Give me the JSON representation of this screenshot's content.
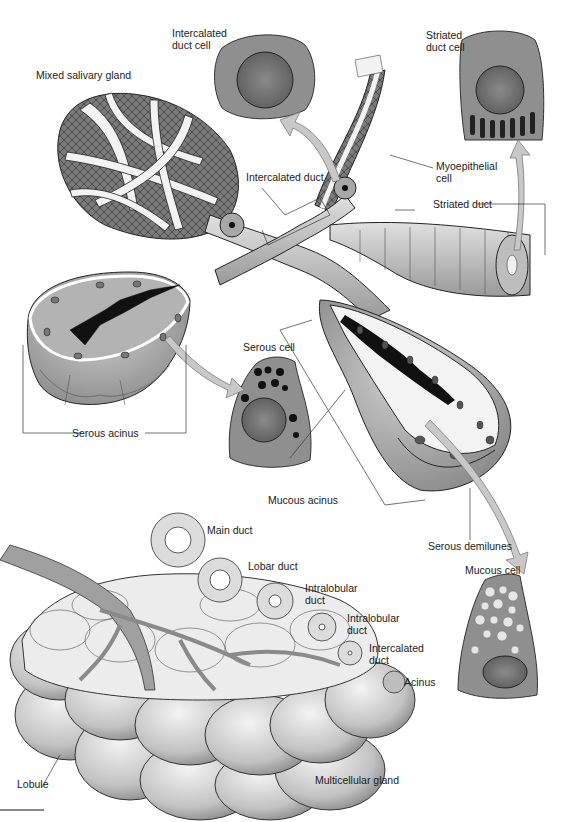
{
  "figure": {
    "colors": {
      "background": "#ffffff",
      "line": "#1a1a1a",
      "tissue_dark": "#6b6b6b",
      "tissue_mid": "#9a9a9a",
      "tissue_light": "#d4d4d4",
      "lumen_black": "#111111",
      "arrow_fill": "#c8c8c8",
      "arrow_stroke": "#7a7a7a"
    }
  },
  "labels": {
    "mixed_salivary_gland": "Mixed salivary gland",
    "intercalated_duct_cell": "Intercalated\nduct cell",
    "striated_duct_cell": "Striated\nduct cell",
    "myoepithelial_cell": "Myoepithelial\ncell",
    "intercalated_duct": "Intercalated duct",
    "striated_duct": "Striated duct",
    "serous_cell": "Serous cell",
    "serous_acinus": "Serous acinus",
    "mucous_acinus": "Mucous acinus",
    "serous_demilunes": "Serous demilunes",
    "mucous_cell": "Mucous cell",
    "main_duct": "Main duct",
    "lobar_duct": "Lobar duct",
    "intralobular_duct_1": "Intralobular\nduct",
    "intralobular_duct_2": "Intralobular\nduct",
    "intercalated_duct_2": "Intercalated\nduct",
    "acinus": "Acinus",
    "lobule": "Lobule",
    "multicellular_gland": "Multicellular gland"
  }
}
